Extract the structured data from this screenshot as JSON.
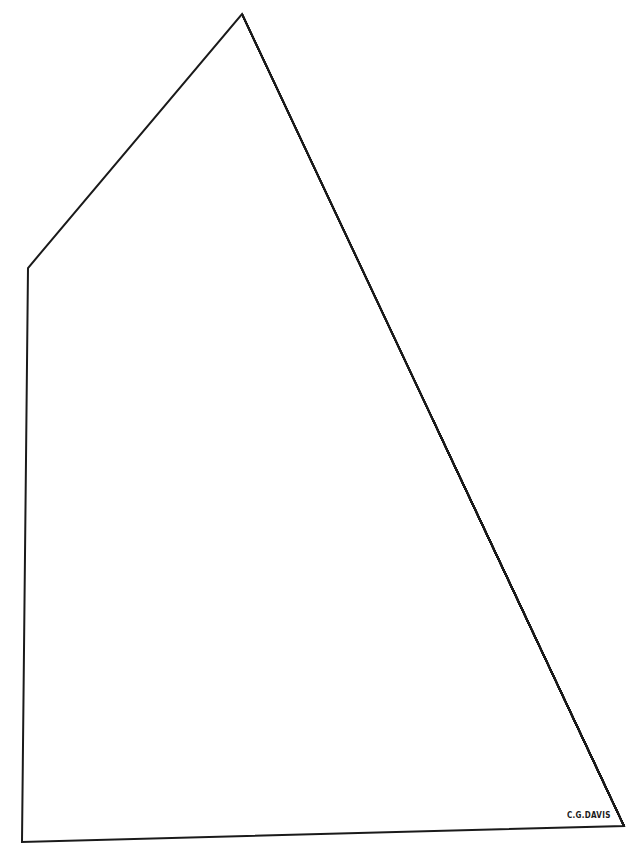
{
  "drawing": {
    "subject": "gaff sail with diagonal hatching",
    "stroke_color": "#1a1a1a",
    "background": "#ffffff",
    "outline": {
      "peak": [
        242,
        14
      ],
      "throat": [
        28,
        268
      ],
      "tack": [
        22,
        842
      ],
      "clew": [
        624,
        826
      ]
    },
    "hatching": {
      "line_count": 30,
      "direction": "down-right, parallel to leech"
    }
  },
  "signature": {
    "text": "C.G.DAVIS"
  }
}
